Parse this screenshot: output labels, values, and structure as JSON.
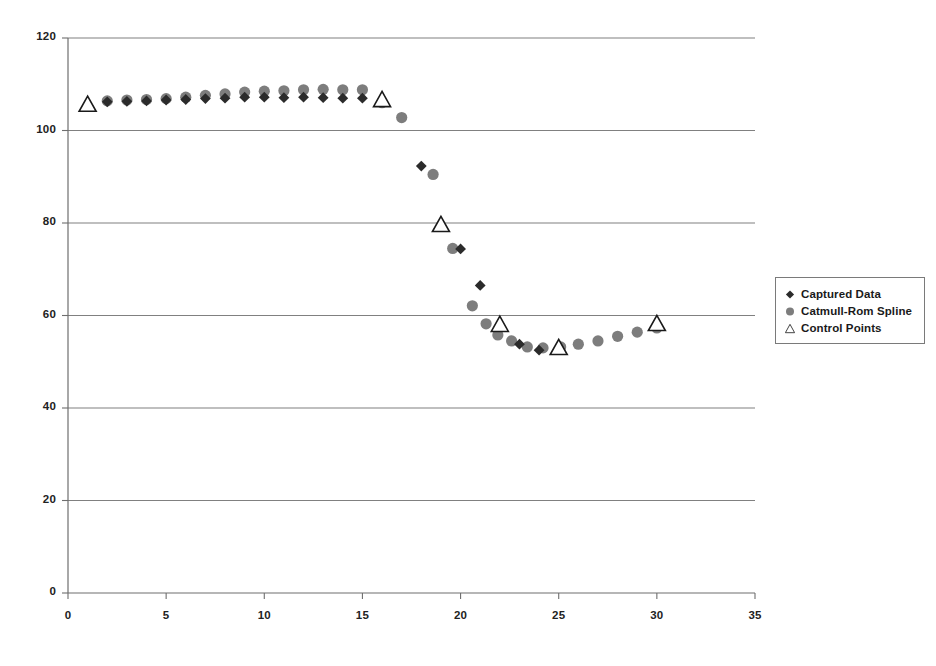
{
  "chart_data": {
    "type": "scatter",
    "title": "",
    "subtitle": "",
    "xlabel": "",
    "ylabel": "",
    "xlim": [
      0,
      35
    ],
    "ylim": [
      0,
      120
    ],
    "xticks": [
      0,
      5,
      10,
      15,
      20,
      25,
      30,
      35
    ],
    "yticks": [
      0,
      20,
      40,
      60,
      80,
      100,
      120
    ],
    "grid": "horizontal",
    "legend_position": "right-outside",
    "series": [
      {
        "name": "Captured Data",
        "marker": "diamond",
        "color": "#2b2b2b",
        "points": [
          [
            2,
            106.2
          ],
          [
            3,
            106.3
          ],
          [
            4,
            106.4
          ],
          [
            5,
            106.6
          ],
          [
            6,
            106.7
          ],
          [
            7,
            106.9
          ],
          [
            8,
            107.0
          ],
          [
            9,
            107.2
          ],
          [
            10,
            107.2
          ],
          [
            11,
            107.1
          ],
          [
            12,
            107.2
          ],
          [
            13,
            107.1
          ],
          [
            14,
            107.0
          ],
          [
            15,
            107.0
          ],
          [
            18,
            92.3
          ],
          [
            20,
            74.4
          ],
          [
            21,
            66.5
          ],
          [
            22,
            57.6
          ],
          [
            23,
            53.8
          ],
          [
            24,
            52.5
          ]
        ]
      },
      {
        "name": "Catmull-Rom Spline",
        "marker": "circle",
        "color": "#7d7d7d",
        "points": [
          [
            2,
            106.4
          ],
          [
            3,
            106.6
          ],
          [
            4,
            106.7
          ],
          [
            5,
            106.9
          ],
          [
            6,
            107.2
          ],
          [
            7,
            107.6
          ],
          [
            8,
            107.9
          ],
          [
            9,
            108.3
          ],
          [
            10,
            108.5
          ],
          [
            11,
            108.6
          ],
          [
            12,
            108.8
          ],
          [
            13,
            108.9
          ],
          [
            14,
            108.8
          ],
          [
            15,
            108.8
          ],
          [
            16,
            106.0
          ],
          [
            17,
            102.8
          ],
          [
            18.6,
            90.5
          ],
          [
            19.6,
            74.5
          ],
          [
            20.6,
            62.1
          ],
          [
            21.3,
            58.2
          ],
          [
            21.9,
            55.8
          ],
          [
            22.6,
            54.5
          ],
          [
            23.4,
            53.2
          ],
          [
            24.2,
            53.0
          ],
          [
            25.1,
            53.2
          ],
          [
            26,
            53.8
          ],
          [
            27,
            54.5
          ],
          [
            28,
            55.5
          ],
          [
            29,
            56.4
          ],
          [
            30,
            57.3
          ]
        ]
      },
      {
        "name": "Control Points",
        "marker": "triangle",
        "color": "#ffffff",
        "edgecolor": "#1a1a1a",
        "points": [
          [
            1,
            105.8
          ],
          [
            16,
            106.8
          ],
          [
            19,
            79.8
          ],
          [
            22,
            58.2
          ],
          [
            25,
            53.2
          ],
          [
            30,
            58.4
          ]
        ]
      }
    ]
  },
  "legend": {
    "items": [
      {
        "label": "Captured Data",
        "marker": "diamond"
      },
      {
        "label": "Catmull-Rom Spline",
        "marker": "circle"
      },
      {
        "label": "Control Points",
        "marker": "triangle"
      }
    ]
  },
  "axis": {
    "x_tick_labels": [
      "0",
      "5",
      "10",
      "15",
      "20",
      "25",
      "30",
      "35"
    ],
    "y_tick_labels": [
      "0",
      "20",
      "40",
      "60",
      "80",
      "100",
      "120"
    ]
  }
}
